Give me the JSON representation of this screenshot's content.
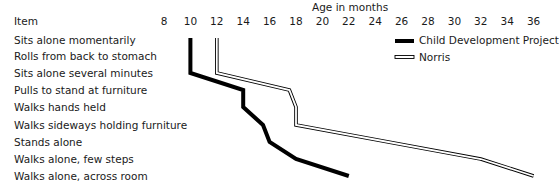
{
  "chart_data": {
    "type": "line",
    "title": "",
    "xlabel": "Age in months",
    "ylabel": "Item",
    "x_ticks": [
      8,
      10,
      12,
      14,
      16,
      18,
      20,
      22,
      24,
      26,
      28,
      30,
      32,
      34,
      36
    ],
    "xlim": [
      8,
      36
    ],
    "categories": [
      "Sits alone momentarily",
      "Rolls from back to stomach",
      "Sits alone several minutes",
      "Pulls to stand at furniture",
      "Walks hands held",
      "Walks sideways holding furniture",
      "Stands alone",
      "Walks alone, few steps",
      "Walks alone, across room"
    ],
    "series": [
      {
        "name": "Child Development Project",
        "style": "thick-solid",
        "color": "#000000",
        "values": [
          10,
          10,
          10,
          14,
          14,
          15.5,
          16,
          18,
          22
        ]
      },
      {
        "name": "Norris",
        "style": "double-outline",
        "color": "#000000",
        "values": [
          12,
          12,
          12,
          17.5,
          18,
          18,
          25,
          32,
          36
        ]
      }
    ],
    "grid": false,
    "legend_position": "upper right"
  },
  "labels": {
    "axis_title": "Age in months",
    "item_header": "Item"
  }
}
